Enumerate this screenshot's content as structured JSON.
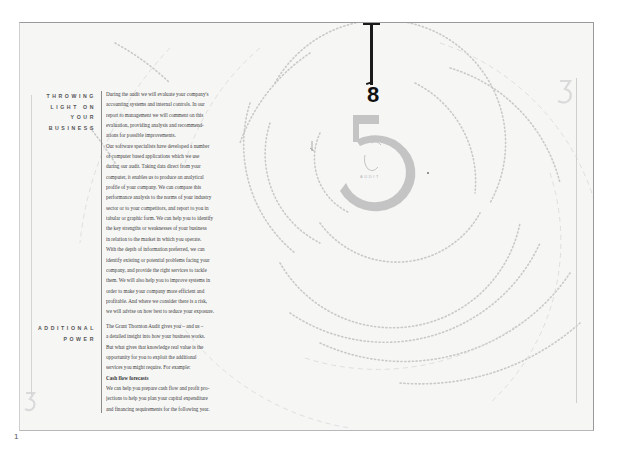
{
  "document": {
    "page_number": "1",
    "big_numeral": "8",
    "emblem": {
      "numeral": "5",
      "caption": "AUDIT"
    }
  },
  "sections": [
    {
      "heading_lines": [
        "THROWING",
        "LIGHT ON",
        "YOUR",
        "BUSINESS"
      ],
      "paragraphs": [
        {
          "lines": [
            "During the audit we will evaluate your company's",
            "accounting systems and internal controls. In our",
            "report to management we will comment on this",
            "evaluation, providing analysis and recommend-",
            "ations for possible improvements."
          ]
        },
        {
          "lines": [
            "Our software specialists have developed a number",
            "of computer based applications which we use",
            "during our audit. Taking data direct from your",
            "computer, it enables us to produce an analytical",
            "profile of your company. We can compare this",
            "performance analysis to the norms of your industry",
            "sector or to your competitors, and report to you in",
            "tabular or graphic form. We can help you to identify",
            "the key strengths or weaknesses of your business",
            "in relation to the market in which you operate."
          ]
        },
        {
          "lines": [
            "With the depth of information preferred, we can",
            "identify existing or potential problems facing your",
            "company, and provide the right services to tackle",
            "them. We will also help you to improve systems in",
            "order to make your company more efficient and",
            "profitable. And where we consider there is a risk,",
            "we will advise on how best to reduce your exposure."
          ]
        }
      ]
    },
    {
      "heading_lines": [
        "ADDITIONAL",
        "POWER"
      ],
      "paragraphs": [
        {
          "lines": [
            "The Grant Thornton Audit gives you – and us –",
            "a detailed insight into how your business works.",
            "But what gives that knowledge real value is the",
            "opportunity for you to exploit the additional",
            "services you might require. For example:"
          ]
        },
        {
          "subheading": "Cash flow forecasts",
          "lines": [
            "We can help you prepare cash flow and profit pro-",
            "jections to help you plan your capital expenditure",
            "and financing requirements for the following year."
          ]
        }
      ]
    }
  ],
  "curved_labels": [
    "MANAGEMENT CONSULTANCY",
    "ADVISORY SERVICES",
    "CORPORATE FINANCE",
    "CONTROLLING OVERHEADS",
    "UNDERTAKING OPERATIONS REVIEWS",
    "PREPARING BUDGETS AND MANAGEMENT STRATEGIES",
    "PROCURING VENTURE CAPITAL",
    "ADVISING ON FLOATATION"
  ],
  "colors": {
    "page_background": "#f6f6f5",
    "text": "#3c3c3c",
    "heading": "#555555",
    "emblem_grey": "#c4c4c4",
    "dotted_arcs": "#c8c8c8",
    "pendulum": "#1a1a1a"
  }
}
